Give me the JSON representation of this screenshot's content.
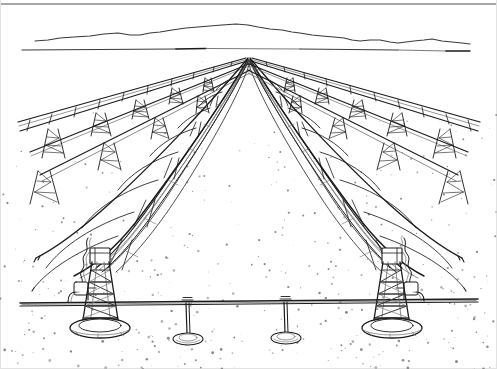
{
  "figure": {
    "title": "Parabolic Trough Solar Collector Field",
    "medium": "pen-and-ink line drawing",
    "style": "two-point linear perspective, black line art on white paper",
    "canvas": {
      "width": 497,
      "height": 369,
      "background": "#ffffff"
    },
    "ink_color": "#1b1b1b",
    "soft_ink_color": "#3a3a3a",
    "faint_ink_color": "#6b6b6b",
    "ground_speckle_color": "#8a8a8a",
    "caption": ""
  },
  "scene": {
    "horizon": {
      "label": "desert horizon line",
      "y": 50,
      "x_start": 22,
      "x_end": 478
    },
    "vanishing_point": {
      "x": 248,
      "y": 56
    },
    "mountains": {
      "label": "distant mountain ridge",
      "ridge_points": "35,41 60,38 90,36 118,33 140,35 160,32 186,28 210,26 236,24 258,27 282,30 300,33 322,36 344,38 360,41 380,40 398,43 414,41 432,39 452,42 470,44",
      "baseline_y": 49
    },
    "ground": {
      "label": "speckled desert floor",
      "texture": "sparse stipple dots",
      "top_y": 50,
      "bottom_y": 369,
      "dot_count": 430
    }
  },
  "collector_rows": [
    {
      "id": "row-far-left",
      "name": "far-left-collector-row",
      "kind": "distant pipe header with lattice pylons",
      "side": "left",
      "pylon_count": 5,
      "depth": "far"
    },
    {
      "id": "row-mid-left",
      "name": "mid-left-collector-row",
      "kind": "distant pipe header with lattice pylons",
      "side": "left",
      "pylon_count": 4,
      "depth": "mid"
    },
    {
      "id": "row-near-left",
      "name": "near-left-parabolic-trough",
      "kind": "parabolic trough reflector array",
      "side": "left",
      "rib_count": 9,
      "depth": "near"
    },
    {
      "id": "row-near-right",
      "name": "near-right-parabolic-trough",
      "kind": "parabolic trough reflector array",
      "side": "right",
      "rib_count": 9,
      "depth": "near"
    },
    {
      "id": "row-mid-right",
      "name": "mid-right-collector-row",
      "kind": "distant pipe header with lattice pylons",
      "side": "right",
      "pylon_count": 4,
      "depth": "mid"
    },
    {
      "id": "row-far-right",
      "name": "far-right-collector-row",
      "kind": "distant pipe header with lattice pylons",
      "side": "right",
      "pylon_count": 5,
      "depth": "far"
    }
  ],
  "foreground": {
    "left_tower": {
      "name": "left-lattice-support-tower",
      "bracing": "zigzag lattice truss",
      "base": "oval concrete footing",
      "center_x": 100,
      "top_y": 250,
      "base_y": 330,
      "flex_hose": "flexible receiver hose coil"
    },
    "right_tower": {
      "name": "right-lattice-support-tower",
      "bracing": "zigzag lattice truss",
      "base": "oval concrete footing",
      "center_x": 392,
      "top_y": 250,
      "base_y": 330,
      "flex_hose": "flexible receiver hose coil"
    },
    "header_pipe": {
      "name": "cross-field-header-pipe",
      "y": 300,
      "x_start": 20,
      "x_end": 478,
      "description": "horizontal heat-transfer-fluid header spanning the foreground"
    },
    "pipe_posts": [
      {
        "name": "pipe-support-post-left",
        "x": 186,
        "top_y": 301,
        "base_y": 338
      },
      {
        "name": "pipe-support-post-right",
        "x": 284,
        "top_y": 301,
        "base_y": 338
      }
    ]
  },
  "legend": {
    "items": [
      {
        "label": "Parabolic trough reflector"
      },
      {
        "label": "Receiver tube"
      },
      {
        "label": "Lattice support tower"
      },
      {
        "label": "Header pipe"
      },
      {
        "label": "Desert ground"
      },
      {
        "label": "Mountain horizon"
      }
    ]
  }
}
